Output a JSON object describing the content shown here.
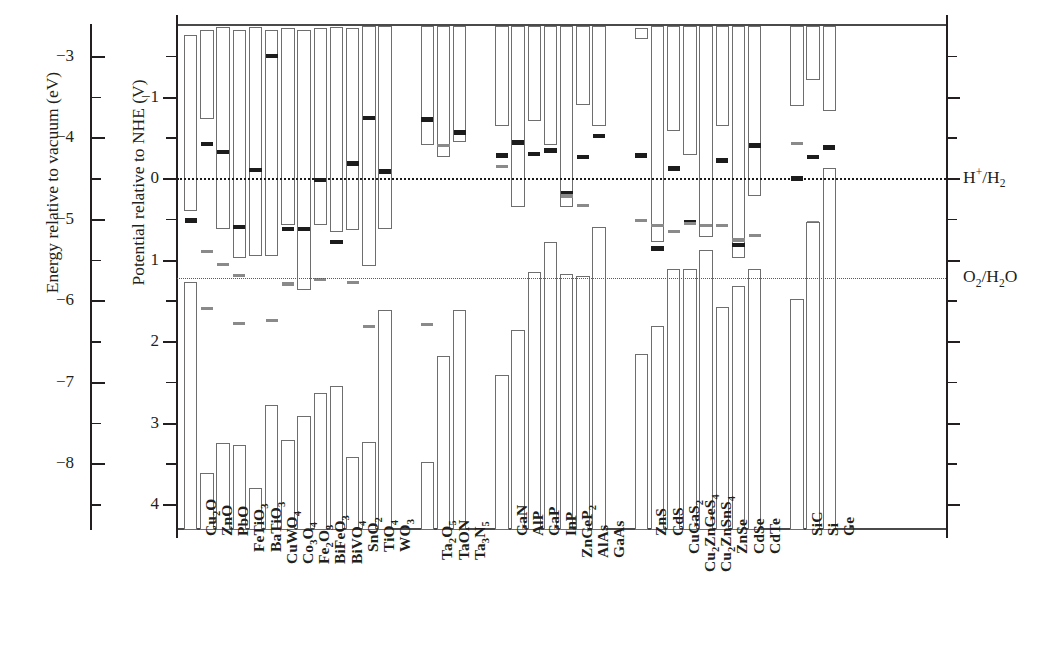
{
  "axes": {
    "left_outer": {
      "title": "Energy relative to vacuum (eV)",
      "ticks": [
        -3,
        -4,
        -5,
        -6,
        -7,
        -8
      ],
      "labels": [
        "−3",
        "−4",
        "−5",
        "−6",
        "−7",
        "−8"
      ]
    },
    "left_inner": {
      "title": "Potential relative to NHE (V)",
      "ticks": [
        -1,
        0,
        1,
        2,
        3,
        4
      ],
      "labels": [
        "−1",
        "0",
        "1",
        "2",
        "3",
        "4"
      ],
      "range": [
        -1.9,
        4.3
      ]
    }
  },
  "redox": [
    {
      "name": "hydrogen-evolution-line",
      "label_html": "H<sup>+</sup>/H<sub>2</sub>",
      "value": 0.0
    },
    {
      "name": "oxygen-evolution-line",
      "label_html": "O<sub>2</sub>/H<sub>2</sub>O",
      "value": 1.23
    }
  ],
  "chart_data": {
    "type": "bar",
    "title": "",
    "xlabel": "",
    "ylabel": "Potential relative to NHE (V)",
    "ylim": [
      4.3,
      -1.9
    ],
    "grid": false,
    "legend": "none",
    "secondary_axis": {
      "label": "Energy relative to vacuum (eV)",
      "ticks": [
        -3,
        -4,
        -5,
        -6,
        -7,
        -8
      ]
    },
    "reference_lines": [
      {
        "label": "H+/H2",
        "value": 0.0,
        "style": "dotted-dark"
      },
      {
        "label": "O2/H2O",
        "value": 1.23,
        "style": "dotted-gray"
      }
    ],
    "categories": [
      "Cu2O",
      "ZnO",
      "PbO",
      "FeTiO3",
      "BaTiO3",
      "CuWO4",
      "Co3O4",
      "Fe2O3",
      "BiFeO3",
      "BiVO4",
      "SnO2",
      "TiO4",
      "WO3",
      "Ta2O5",
      "TaON",
      "Ta3N5",
      "GaN",
      "AlP",
      "GaP",
      "InP",
      "ZnGeP2",
      "AlAs",
      "GaAs",
      "ZnS",
      "CdS",
      "CuGaS2",
      "Cu2ZnGeS4",
      "Cu2ZnSnS4",
      "ZnSe",
      "CdSe",
      "CdTe",
      "SiC",
      "Si",
      "Ge"
    ],
    "category_labels_html": [
      "Cu<sub>2</sub>O",
      "ZnO",
      "PbO",
      "FeTiO<sub>3</sub>",
      "BaTiO<sub>3</sub>",
      "CuWO<sub>4</sub>",
      "Co<sub>3</sub>O<sub>4</sub>",
      "Fe<sub>2</sub>O<sub>3</sub>",
      "BiFeO<sub>3</sub>",
      "BiVO<sub>4</sub>",
      "SnO<sub>2</sub>",
      "TiO<sub>4</sub>",
      "WO<sub>3</sub>",
      "Ta<sub>2</sub>O<sub>5</sub>",
      "TaON",
      "Ta<sub>3</sub>N<sub>5</sub>",
      "GaN",
      "AlP",
      "GaP",
      "InP",
      "ZnGeP<sub>2</sub>",
      "AlAs",
      "GaAs",
      "ZnS",
      "CdS",
      "CuGaS<sub>2</sub>",
      "Cu<sub>2</sub>ZnGeS<sub>4</sub>",
      "Cu<sub>2</sub>ZnSnS<sub>4</sub>",
      "ZnSe",
      "CdSe",
      "CdTe",
      "SiC",
      "Si",
      "Ge"
    ],
    "bars": [
      {
        "category": "Cu2O",
        "cbm": -1.75,
        "vbm": 0.4,
        "marks": [
          0.52
        ]
      },
      {
        "category": "Cu2O",
        "cbm": 1.28,
        "vbm": 4.32,
        "marks": []
      },
      {
        "category": "ZnO",
        "cbm": -1.82,
        "vbm": -0.72,
        "marks": [
          -0.42
        ],
        "gray_marks": [
          0.9,
          1.6
        ]
      },
      {
        "category": "ZnO",
        "cbm": 3.62,
        "vbm": 4.32,
        "marks": []
      },
      {
        "category": "PbO",
        "cbm": -1.85,
        "vbm": 0.62,
        "marks": [
          -0.32
        ],
        "gray_marks": [
          1.06
        ]
      },
      {
        "category": "PbO",
        "cbm": 3.25,
        "vbm": 4.32,
        "marks": []
      },
      {
        "category": "FeTiO3",
        "cbm": -1.82,
        "vbm": 0.98,
        "marks": [
          0.6
        ],
        "gray_marks": [
          1.2,
          1.78
        ]
      },
      {
        "category": "FeTiO3",
        "cbm": 3.28,
        "vbm": 4.32,
        "marks": []
      },
      {
        "category": "BaTiO3",
        "cbm": -1.85,
        "vbm": 0.96,
        "marks": [
          -0.1
        ]
      },
      {
        "category": "BaTiO3",
        "cbm": 3.8,
        "vbm": 4.32,
        "marks": []
      },
      {
        "category": "CuWO4",
        "cbm": -1.82,
        "vbm": 0.96,
        "marks": [
          -1.5
        ],
        "gray_marks": [
          1.75
        ]
      },
      {
        "category": "CuWO4",
        "cbm": 2.78,
        "vbm": 4.32,
        "marks": []
      },
      {
        "category": "Co3O4",
        "cbm": -1.84,
        "vbm": 0.58,
        "marks": [
          0.62
        ],
        "gray_marks": [
          1.3
        ]
      },
      {
        "category": "Co3O4",
        "cbm": 3.22,
        "vbm": 4.32,
        "marks": []
      },
      {
        "category": "Fe2O3",
        "cbm": -1.82,
        "vbm": 1.38,
        "marks": [
          0.62
        ]
      },
      {
        "category": "Fe2O3",
        "cbm": 2.92,
        "vbm": 4.32,
        "marks": []
      },
      {
        "category": "BiFeO3",
        "cbm": -1.84,
        "vbm": 0.58,
        "marks": [
          0.02
        ],
        "gray_marks": [
          1.24
        ]
      },
      {
        "category": "BiFeO3",
        "cbm": 2.64,
        "vbm": 4.32,
        "marks": []
      },
      {
        "category": "BiVO4",
        "cbm": -1.85,
        "vbm": 0.66,
        "marks": [
          0.78
        ]
      },
      {
        "category": "BiVO4",
        "cbm": 2.55,
        "vbm": 4.32,
        "marks": []
      },
      {
        "category": "SnO2",
        "cbm": -1.84,
        "vbm": 0.64,
        "marks": [
          -0.18
        ],
        "gray_marks": [
          1.28
        ]
      },
      {
        "category": "SnO2",
        "cbm": 3.42,
        "vbm": 4.32,
        "marks": []
      },
      {
        "category": "TiO4",
        "cbm": -1.86,
        "vbm": 1.08,
        "marks": [
          -0.74
        ],
        "gray_marks": [
          1.82
        ]
      },
      {
        "category": "TiO4",
        "cbm": 3.24,
        "vbm": 4.32,
        "marks": []
      },
      {
        "category": "WO3",
        "cbm": -1.86,
        "vbm": 0.62,
        "marks": [
          -0.08
        ]
      },
      {
        "category": "WO3",
        "cbm": 1.62,
        "vbm": 4.32,
        "marks": []
      },
      {
        "category": "Ta2O5",
        "cbm": -1.86,
        "vbm": -0.4,
        "marks": [
          -0.72
        ],
        "gray_marks": [
          1.8
        ]
      },
      {
        "category": "Ta2O5",
        "cbm": 3.48,
        "vbm": 4.32,
        "marks": []
      },
      {
        "category": "TaON",
        "cbm": -1.86,
        "vbm": -0.26,
        "marks": [],
        "gray_marks": [
          -0.4
        ]
      },
      {
        "category": "TaON",
        "cbm": 2.18,
        "vbm": 4.32,
        "marks": []
      },
      {
        "category": "Ta3N5",
        "cbm": -1.86,
        "vbm": -0.44,
        "marks": [
          -0.56
        ]
      },
      {
        "category": "Ta3N5",
        "cbm": 1.62,
        "vbm": 4.32,
        "marks": []
      },
      {
        "category": "GaN",
        "cbm": -1.86,
        "vbm": -0.64,
        "marks": [
          -0.28
        ],
        "gray_marks": [
          -0.14
        ]
      },
      {
        "category": "GaN",
        "cbm": 2.42,
        "vbm": 4.32,
        "marks": []
      },
      {
        "category": "AlP",
        "cbm": -1.86,
        "vbm": 0.36,
        "marks": [
          -0.44
        ]
      },
      {
        "category": "AlP",
        "cbm": 1.86,
        "vbm": 4.32,
        "marks": []
      },
      {
        "category": "GaP",
        "cbm": -1.86,
        "vbm": -0.7,
        "marks": [
          -0.3
        ]
      },
      {
        "category": "GaP",
        "cbm": 1.15,
        "vbm": 4.32,
        "marks": []
      },
      {
        "category": "InP",
        "cbm": -1.86,
        "vbm": -0.4,
        "marks": [
          -0.34
        ]
      },
      {
        "category": "InP",
        "cbm": 0.78,
        "vbm": 4.32,
        "marks": []
      },
      {
        "category": "ZnGeP2",
        "cbm": -1.86,
        "vbm": 0.36,
        "marks": [
          0.18
        ],
        "gray_marks": [
          0.22
        ]
      },
      {
        "category": "ZnGeP2",
        "cbm": 1.18,
        "vbm": 4.32,
        "marks": []
      },
      {
        "category": "AlAs",
        "cbm": -1.86,
        "vbm": -0.9,
        "marks": [
          -0.26
        ],
        "gray_marks": [
          0.34
        ]
      },
      {
        "category": "AlAs",
        "cbm": 1.2,
        "vbm": 4.32,
        "marks": []
      },
      {
        "category": "GaAs",
        "cbm": -1.86,
        "vbm": -0.64,
        "marks": [
          -0.52
        ]
      },
      {
        "category": "GaAs",
        "cbm": 0.6,
        "vbm": 4.32,
        "marks": []
      },
      {
        "category": "ZnS",
        "cbm": -1.84,
        "vbm": -1.7,
        "marks": [
          -0.28
        ],
        "gray_marks": [
          0.52
        ]
      },
      {
        "category": "ZnS",
        "cbm": 2.16,
        "vbm": 4.32,
        "marks": []
      },
      {
        "category": "CdS",
        "cbm": -1.86,
        "vbm": 0.78,
        "marks": [
          0.86
        ],
        "gray_marks": [
          0.58
        ]
      },
      {
        "category": "CdS",
        "cbm": 1.82,
        "vbm": 4.32,
        "marks": []
      },
      {
        "category": "CuGaS2",
        "cbm": -1.86,
        "vbm": -0.58,
        "marks": [
          -0.12
        ],
        "gray_marks": [
          0.66
        ]
      },
      {
        "category": "CuGaS2",
        "cbm": 1.12,
        "vbm": 4.32,
        "marks": []
      },
      {
        "category": "Cu2ZnGeS4",
        "cbm": -1.86,
        "vbm": -0.28,
        "marks": [
          0.54
        ],
        "gray_marks": [
          0.56
        ]
      },
      {
        "category": "Cu2ZnGeS4",
        "cbm": 1.12,
        "vbm": 4.32,
        "marks": []
      },
      {
        "category": "Cu2ZnSnS4",
        "cbm": -1.86,
        "vbm": 0.72,
        "marks": [
          0.96
        ],
        "gray_marks": [
          0.58
        ]
      },
      {
        "category": "Cu2ZnSnS4",
        "cbm": 0.88,
        "vbm": 4.32,
        "marks": []
      },
      {
        "category": "ZnSe",
        "cbm": -1.86,
        "vbm": -0.64,
        "marks": [
          -0.22
        ],
        "gray_marks": [
          0.58
        ]
      },
      {
        "category": "ZnSe",
        "cbm": 1.58,
        "vbm": 4.32,
        "marks": []
      },
      {
        "category": "CdSe",
        "cbm": -1.86,
        "vbm": 0.98,
        "marks": [
          0.82
        ],
        "gray_marks": [
          0.76
        ]
      },
      {
        "category": "CdSe",
        "cbm": 1.32,
        "vbm": 4.32,
        "marks": []
      },
      {
        "category": "CdTe",
        "cbm": -1.86,
        "vbm": 0.22,
        "marks": [
          -0.4
        ],
        "gray_marks": [
          0.7
        ]
      },
      {
        "category": "CdTe",
        "cbm": 1.12,
        "vbm": 4.32,
        "marks": []
      },
      {
        "category": "SiC",
        "cbm": -1.86,
        "vbm": -0.88,
        "marks": [
          0.0
        ],
        "gray_marks": [
          -0.42
        ]
      },
      {
        "category": "SiC",
        "cbm": 1.48,
        "vbm": 4.32,
        "marks": []
      },
      {
        "category": "Si",
        "cbm": -1.86,
        "vbm": -1.2,
        "marks": [
          -0.26
        ],
        "gray_marks": [
          0.54
        ]
      },
      {
        "category": "Si",
        "cbm": 0.54,
        "vbm": 4.32,
        "marks": []
      },
      {
        "category": "Ge",
        "cbm": -1.86,
        "vbm": -0.82,
        "marks": [
          -0.38
        ],
        "gray_marks": [
          -0.08
        ]
      },
      {
        "category": "Ge",
        "cbm": -0.12,
        "vbm": 4.32,
        "marks": []
      }
    ]
  }
}
